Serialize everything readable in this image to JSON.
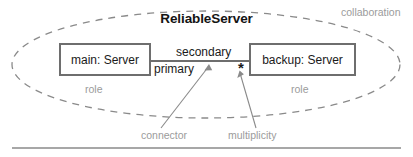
{
  "diagram": {
    "kind": "uml-collaboration-diagram",
    "collaboration": {
      "name": "ReliableServer",
      "annotation": "collaboration"
    },
    "parts": [
      {
        "id": "main",
        "label": "main: Server",
        "annotation": "role"
      },
      {
        "id": "backup",
        "label": "backup: Server",
        "annotation": "role"
      }
    ],
    "connector": {
      "end_labels": {
        "upper": "secondary",
        "lower": "primary"
      },
      "multiplicity": "*",
      "annotation_connector": "connector",
      "annotation_multiplicity": "multiplicity"
    },
    "colors": {
      "ink": "#1a1a1a",
      "box_border": "#6e6e6e",
      "annotation_gray": "#9b9b9b",
      "ellipse_dash": "#8a8a8a",
      "rule": "#8a8a8a",
      "background": "#ffffff"
    }
  }
}
